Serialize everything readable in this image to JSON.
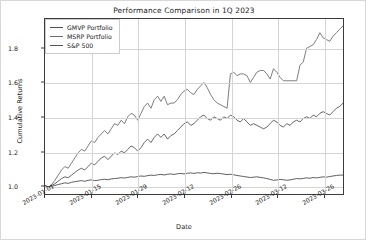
{
  "chart_data": {
    "type": "line",
    "title": "Performance Comparison in 1Q 2023",
    "xlabel": "Date",
    "ylabel": "Cumulative Returns",
    "grid": true,
    "legend_position": "upper left",
    "ylim": [
      0.95,
      1.97
    ],
    "yticks": [
      "1.0",
      "1.2",
      "1.4",
      "1.6",
      "1.8"
    ],
    "ytick_values": [
      1.0,
      1.2,
      1.4,
      1.6,
      1.8
    ],
    "xticks": [
      "2023-01-01",
      "2023-01-15",
      "2023-01-29",
      "2023-02-12",
      "2023-02-26",
      "2023-03-12",
      "2023-03-26"
    ],
    "xtick_positions": [
      0,
      14,
      28,
      42,
      56,
      70,
      84
    ],
    "xlim": [
      0,
      90
    ],
    "x": [
      0,
      1,
      2,
      3,
      4,
      5,
      6,
      7,
      8,
      9,
      10,
      11,
      12,
      13,
      14,
      15,
      16,
      17,
      18,
      19,
      20,
      21,
      22,
      23,
      24,
      25,
      26,
      27,
      28,
      29,
      30,
      31,
      32,
      33,
      34,
      35,
      36,
      37,
      38,
      39,
      40,
      41,
      42,
      43,
      44,
      45,
      46,
      47,
      48,
      49,
      50,
      51,
      52,
      53,
      54,
      55,
      56,
      57,
      58,
      59,
      60,
      61,
      62,
      63,
      64,
      65,
      66,
      67,
      68,
      69,
      70,
      71,
      72,
      73,
      74,
      75,
      76,
      77,
      78,
      79,
      80,
      81,
      82,
      83,
      84,
      85,
      86,
      87,
      88,
      89,
      90
    ],
    "series": [
      {
        "name": "GMVP Portfolio",
        "color": "#4d4d4d",
        "final_value": 1.06,
        "values": [
          1.0,
          0.99,
          0.995,
          1.0,
          1.005,
          1.01,
          1.015,
          1.012,
          1.018,
          1.022,
          1.025,
          1.028,
          1.024,
          1.03,
          1.032,
          1.028,
          1.03,
          1.034,
          1.036,
          1.033,
          1.038,
          1.04,
          1.042,
          1.045,
          1.043,
          1.047,
          1.05,
          1.048,
          1.052,
          1.055,
          1.053,
          1.057,
          1.06,
          1.058,
          1.062,
          1.064,
          1.061,
          1.065,
          1.067,
          1.064,
          1.068,
          1.07,
          1.067,
          1.071,
          1.073,
          1.07,
          1.074,
          1.072,
          1.076,
          1.073,
          1.07,
          1.068,
          1.071,
          1.069,
          1.066,
          1.063,
          1.065,
          1.062,
          1.058,
          1.055,
          1.052,
          1.049,
          1.046,
          1.048,
          1.05,
          1.047,
          1.044,
          1.04,
          1.035,
          1.03,
          1.032,
          1.035,
          1.033,
          1.03,
          1.032,
          1.036,
          1.04,
          1.038,
          1.041,
          1.044,
          1.042,
          1.046,
          1.044,
          1.047,
          1.05,
          1.048,
          1.052,
          1.055,
          1.058,
          1.06,
          1.06
        ]
      },
      {
        "name": "MSRP Portfolio",
        "color": "#6e6e6e",
        "final_value": 1.93,
        "values": [
          1.0,
          0.985,
          1.005,
          1.03,
          1.06,
          1.09,
          1.11,
          1.1,
          1.13,
          1.16,
          1.19,
          1.21,
          1.2,
          1.23,
          1.26,
          1.25,
          1.28,
          1.3,
          1.32,
          1.3,
          1.33,
          1.36,
          1.35,
          1.38,
          1.36,
          1.4,
          1.42,
          1.41,
          1.38,
          1.42,
          1.46,
          1.48,
          1.45,
          1.5,
          1.52,
          1.49,
          1.52,
          1.47,
          1.48,
          1.48,
          1.5,
          1.53,
          1.55,
          1.56,
          1.54,
          1.53,
          1.56,
          1.58,
          1.6,
          1.57,
          1.53,
          1.5,
          1.48,
          1.47,
          1.46,
          1.45,
          1.65,
          1.66,
          1.64,
          1.65,
          1.65,
          1.64,
          1.6,
          1.63,
          1.66,
          1.67,
          1.67,
          1.65,
          1.62,
          1.68,
          1.66,
          1.63,
          1.61,
          1.61,
          1.61,
          1.61,
          1.61,
          1.7,
          1.72,
          1.8,
          1.81,
          1.82,
          1.85,
          1.89,
          1.86,
          1.85,
          1.84,
          1.87,
          1.89,
          1.91,
          1.93
        ]
      },
      {
        "name": "S&P 500",
        "color": "#555555",
        "final_value": 1.48,
        "values": [
          1.0,
          0.99,
          1.0,
          1.01,
          1.025,
          1.04,
          1.05,
          1.045,
          1.06,
          1.075,
          1.09,
          1.1,
          1.09,
          1.11,
          1.13,
          1.12,
          1.14,
          1.16,
          1.17,
          1.15,
          1.17,
          1.19,
          1.18,
          1.2,
          1.19,
          1.21,
          1.23,
          1.22,
          1.2,
          1.22,
          1.25,
          1.27,
          1.25,
          1.28,
          1.3,
          1.28,
          1.3,
          1.27,
          1.29,
          1.3,
          1.32,
          1.34,
          1.36,
          1.37,
          1.35,
          1.36,
          1.38,
          1.4,
          1.41,
          1.39,
          1.38,
          1.4,
          1.39,
          1.38,
          1.4,
          1.39,
          1.41,
          1.4,
          1.38,
          1.37,
          1.39,
          1.37,
          1.35,
          1.36,
          1.35,
          1.34,
          1.33,
          1.34,
          1.36,
          1.38,
          1.37,
          1.35,
          1.34,
          1.36,
          1.35,
          1.37,
          1.38,
          1.37,
          1.39,
          1.4,
          1.39,
          1.41,
          1.4,
          1.42,
          1.43,
          1.42,
          1.41,
          1.43,
          1.45,
          1.46,
          1.48
        ]
      }
    ]
  },
  "legend": {
    "items": [
      {
        "label": "GMVP Portfolio"
      },
      {
        "label": "MSRP Portfolio"
      },
      {
        "label": "S&P 500"
      }
    ]
  }
}
